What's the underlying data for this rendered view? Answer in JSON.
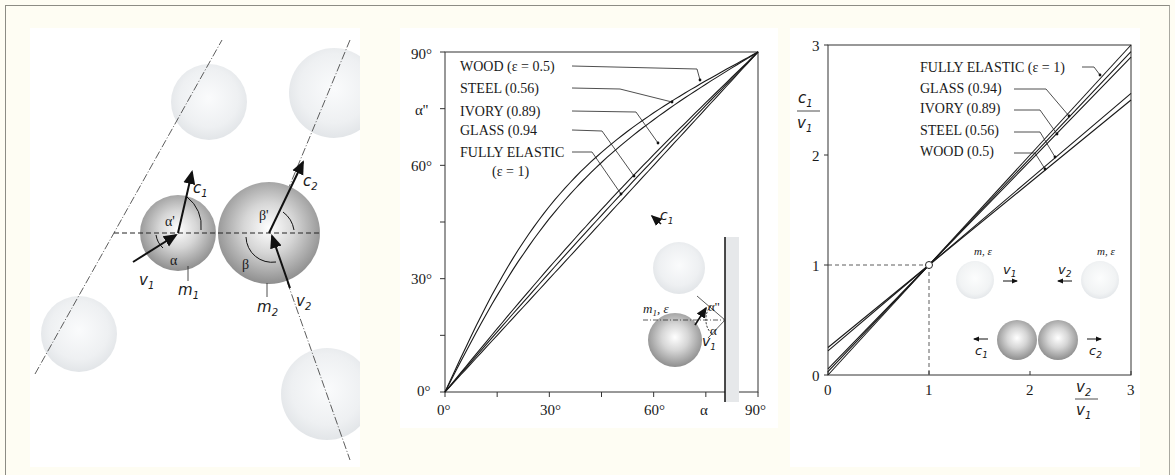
{
  "figure": {
    "colors": {
      "background": "#fefdf3",
      "panel": "#ffffff",
      "frame_border": "#8c8c84",
      "ink": "#1a1a1a",
      "sphere_dark": "#8e8e8e",
      "sphere_ghost": "#e6e8ea"
    }
  },
  "left_panel": {
    "labels": {
      "c1": "c",
      "c1_sub": "1",
      "c2": "c",
      "c2_sub": "2",
      "v1": "v",
      "v1_sub": "1",
      "v2": "v",
      "v2_sub": "2",
      "m1": "m",
      "m1_sub": "1",
      "m2": "m",
      "m2_sub": "2",
      "alpha": "α",
      "alpha_prime": "α'",
      "beta": "β",
      "beta_prime": "β'"
    }
  },
  "mid_panel": {
    "legend": [
      {
        "label": "WOOD (ε = 0.5)"
      },
      {
        "label": "STEEL (0.56)"
      },
      {
        "label": "IVORY (0.89)"
      },
      {
        "label": "GLASS (0.94"
      },
      {
        "label": "FULLY ELASTIC"
      },
      {
        "label": "(ε = 1)"
      }
    ],
    "inset": {
      "c1": "c",
      "c1_sub": "1",
      "m1_eps": "m",
      "m1_eps_sub": "1",
      "m1_eps_rest": ", ε",
      "v1": "v",
      "v1_sub": "1",
      "alpha": "α",
      "alpha_dd": "α''"
    }
  },
  "right_panel": {
    "legend": [
      {
        "label": "FULLY ELASTIC (ε = 1)"
      },
      {
        "label": "GLASS (0.94)"
      },
      {
        "label": "IVORY (0.89)"
      },
      {
        "label": "STEEL (0.56)"
      },
      {
        "label": "WOOD (0.5)"
      }
    ],
    "ylabel_num": "c",
    "ylabel_num_sub": "1",
    "ylabel_den": "v",
    "ylabel_den_sub": "1",
    "xlabel_num": "v",
    "xlabel_num_sub": "2",
    "xlabel_den": "v",
    "xlabel_den_sub": "1",
    "inset": {
      "m_eps_left": "m, ε",
      "m_eps_right": "m, ε",
      "v1": "v",
      "v1_sub": "1",
      "v2": "v",
      "v2_sub": "2",
      "c1": "c",
      "c1_sub": "1",
      "c2": "c",
      "c2_sub": "2"
    }
  },
  "chart_data": [
    {
      "type": "line",
      "title": "Rebound angle vs. incidence angle (ball against wall)",
      "xlabel": "α",
      "ylabel": "α''",
      "xlim": [
        0,
        90
      ],
      "ylim": [
        0,
        90
      ],
      "x_ticks": [
        "0°",
        "30°",
        "60°",
        "90°"
      ],
      "y_ticks": [
        "0°",
        "30°",
        "60°",
        "90°"
      ],
      "minor_tick_step": 15,
      "grid": false,
      "legend_position": "upper-left (inside, leader lines)",
      "x": [
        0,
        15,
        30,
        45,
        60,
        75,
        90
      ],
      "series": [
        {
          "name": "WOOD (ε = 0.5)",
          "values": [
            0,
            28.2,
            49.1,
            63.4,
            73.9,
            82.4,
            90
          ]
        },
        {
          "name": "STEEL (0.56)",
          "values": [
            0,
            25.6,
            45.9,
            60.8,
            72.1,
            81.5,
            90
          ]
        },
        {
          "name": "IVORY (0.89)",
          "values": [
            0,
            16.8,
            33.0,
            48.3,
            62.8,
            76.6,
            90
          ]
        },
        {
          "name": "GLASS (0.94",
          "values": [
            0,
            15.9,
            31.6,
            46.8,
            61.5,
            75.9,
            90
          ]
        },
        {
          "name": "FULLY ELASTIC (ε = 1)",
          "values": [
            0,
            15,
            30,
            45,
            60,
            75,
            90
          ]
        }
      ]
    },
    {
      "type": "line",
      "title": "Rebound velocity ratio vs. approach velocity ratio (equal masses)",
      "xlabel": "v2/v1",
      "ylabel": "c1/v1",
      "xlim": [
        0,
        3
      ],
      "ylim": [
        0,
        3
      ],
      "x_ticks": [
        "0",
        "1",
        "2",
        "3"
      ],
      "y_ticks": [
        "0",
        "1",
        "2",
        "3"
      ],
      "grid": false,
      "annotations": [
        "dashed guide lines to point (1, 1)",
        "open circle marker at (1, 1)"
      ],
      "legend_position": "upper-left (inside, leader lines)",
      "x": [
        0,
        1,
        2,
        3
      ],
      "series": [
        {
          "name": "FULLY ELASTIC (ε = 1)",
          "values": [
            0,
            1,
            2,
            3
          ]
        },
        {
          "name": "GLASS (0.94)",
          "values": [
            0.03,
            1,
            1.97,
            2.94
          ]
        },
        {
          "name": "IVORY (0.89)",
          "values": [
            0.055,
            1,
            1.945,
            2.89
          ]
        },
        {
          "name": "STEEL (0.56)",
          "values": [
            0.22,
            1,
            1.78,
            2.56
          ]
        },
        {
          "name": "WOOD (0.5)",
          "values": [
            0.25,
            1,
            1.75,
            2.5
          ]
        }
      ]
    }
  ]
}
